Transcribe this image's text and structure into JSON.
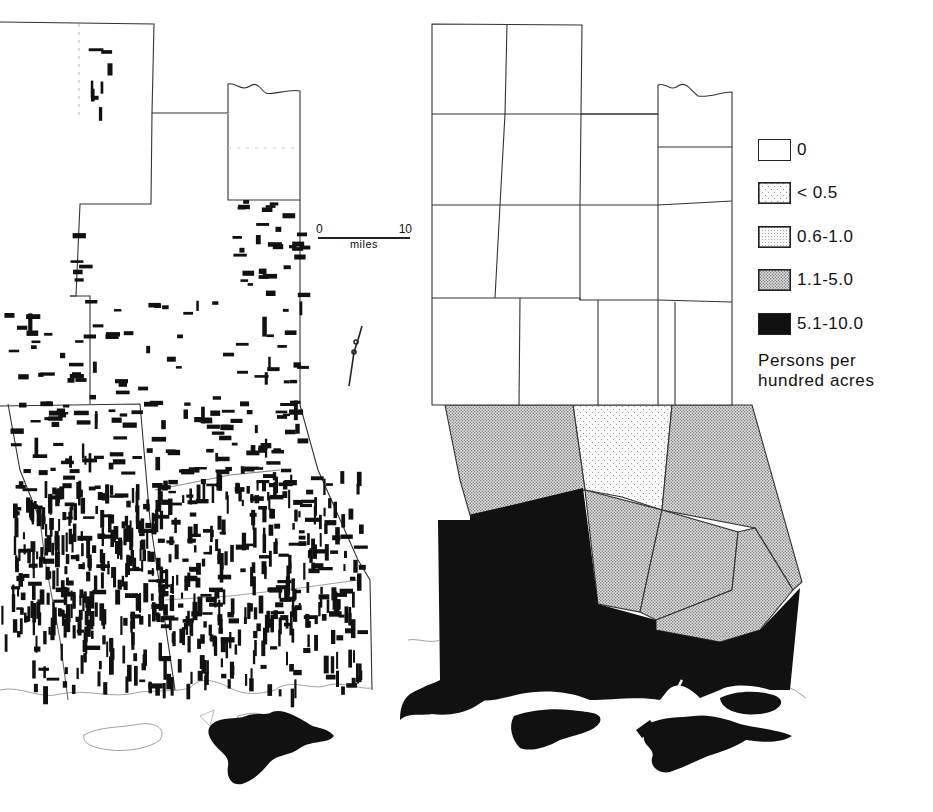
{
  "figure": {
    "left_map": {
      "name": "dot-distribution map",
      "description": "Settled tracts shown as black rectangles within county outlines",
      "scale_bar": {
        "start_label": "0",
        "end_label": "10",
        "unit_label": "miles"
      }
    },
    "right_map": {
      "name": "choropleth map",
      "description": "Counties shaded by population density class"
    },
    "legend": {
      "items": [
        {
          "label": "0",
          "pattern": "blank",
          "fill": "#ffffff"
        },
        {
          "label": "< 0.5",
          "pattern": "sparse-dots",
          "fill": "#f4f4f4"
        },
        {
          "label": "0.6-1.0",
          "pattern": "fine-dots",
          "fill": "#e6e6e6"
        },
        {
          "label": "1.1-5.0",
          "pattern": "dense-dots",
          "fill": "#cfcfcf"
        },
        {
          "label": "5.1-10.0",
          "pattern": "solid",
          "fill": "#111111"
        }
      ],
      "caption_line1": "Persons per",
      "caption_line2": "hundred acres"
    },
    "colors": {
      "ink": "#111111",
      "outline": "#333333",
      "paper": "#ffffff"
    }
  }
}
